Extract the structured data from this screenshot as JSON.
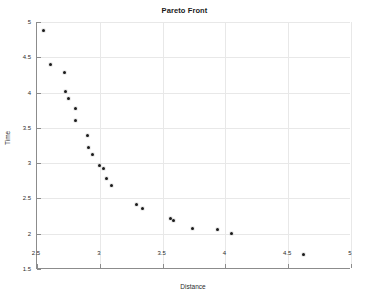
{
  "chart_data": {
    "type": "scatter",
    "title": "Pareto Front",
    "xlabel": "Distance",
    "ylabel": "Time",
    "xlim": [
      2.5,
      5
    ],
    "ylim": [
      1.5,
      5
    ],
    "grid": true,
    "legend": null,
    "marker_color": "#1a1a1a",
    "xticks": [
      "2.5",
      "3",
      "3.5",
      "4",
      "4.5",
      "5"
    ],
    "xtick_values": [
      2.5,
      3,
      3.5,
      4,
      4.5,
      5
    ],
    "yticks": [
      "1.5",
      "2",
      "2.5",
      "3",
      "3.5",
      "4",
      "4.5",
      "5"
    ],
    "ytick_values": [
      1.5,
      2,
      2.5,
      3,
      3.5,
      4,
      4.5,
      5
    ],
    "series": [
      {
        "name": "Pareto Front",
        "points": [
          {
            "x": 2.55,
            "y": 4.88
          },
          {
            "x": 2.61,
            "y": 4.4
          },
          {
            "x": 2.72,
            "y": 4.28
          },
          {
            "x": 2.73,
            "y": 4.01
          },
          {
            "x": 2.75,
            "y": 3.92
          },
          {
            "x": 2.81,
            "y": 3.78
          },
          {
            "x": 2.81,
            "y": 3.61
          },
          {
            "x": 2.9,
            "y": 3.39
          },
          {
            "x": 2.91,
            "y": 3.22
          },
          {
            "x": 2.94,
            "y": 3.12
          },
          {
            "x": 3.0,
            "y": 2.97
          },
          {
            "x": 3.03,
            "y": 2.93
          },
          {
            "x": 3.05,
            "y": 2.78
          },
          {
            "x": 3.09,
            "y": 2.69
          },
          {
            "x": 3.29,
            "y": 2.41
          },
          {
            "x": 3.34,
            "y": 2.36
          },
          {
            "x": 3.56,
            "y": 2.22
          },
          {
            "x": 3.59,
            "y": 2.19
          },
          {
            "x": 3.74,
            "y": 2.07
          },
          {
            "x": 3.94,
            "y": 2.06
          },
          {
            "x": 4.05,
            "y": 2.0
          },
          {
            "x": 4.62,
            "y": 1.71
          }
        ]
      }
    ]
  }
}
